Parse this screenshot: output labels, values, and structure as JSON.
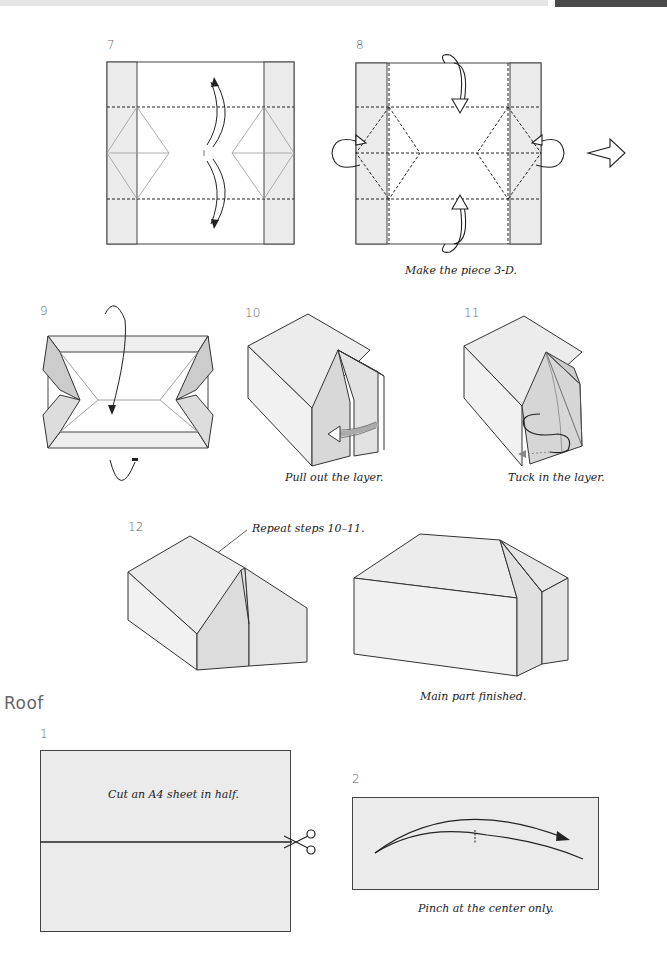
{
  "header": {
    "bar_color": "#e6e6e6",
    "tab_color": "#4a4a4a"
  },
  "steps": {
    "s7": {
      "number": "7"
    },
    "s8": {
      "number": "8",
      "caption": "Make the piece 3-D."
    },
    "s9": {
      "number": "9"
    },
    "s10": {
      "number": "10",
      "caption": "Pull out the layer."
    },
    "s11": {
      "number": "11",
      "caption": "Tuck in the layer."
    },
    "s12": {
      "number": "12",
      "annotation": "Repeat steps 10–11."
    },
    "finished": {
      "caption": "Main part finished."
    }
  },
  "roof": {
    "title": "Roof",
    "s1": {
      "number": "1",
      "caption": "Cut an A4 sheet in half."
    },
    "s2": {
      "number": "2",
      "caption": "Pinch at the center only."
    }
  },
  "colors": {
    "paper_gray": "#ebebeb",
    "line": "#333333",
    "shade": "#d9d9d9"
  }
}
